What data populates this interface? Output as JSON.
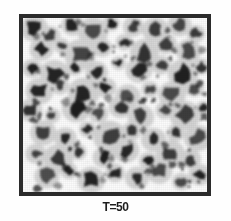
{
  "figure": {
    "caption": "T=50",
    "alt_label": "micrograph-panel",
    "frame": {
      "border_color": "#2b2b2b",
      "background_color": "#fbfbfb",
      "border_width_px": 4,
      "x": 19,
      "y": 14,
      "width": 192,
      "height": 182
    },
    "page_background": "#ffffff",
    "particle_color": "#1a1a1a",
    "halo_color": "#8a8a8a"
  },
  "chart_data": {
    "type": "scatter",
    "title": "T=50",
    "xlabel": "",
    "ylabel": "",
    "xlim": [
      0,
      100
    ],
    "ylim": [
      0,
      100
    ],
    "grid": false,
    "legend": null,
    "series": [
      {
        "name": "dark particles",
        "color": "#1a1a1a",
        "points": [
          {
            "x": 6,
            "y": 94,
            "r": 4.2
          },
          {
            "x": 15,
            "y": 90,
            "r": 3.0
          },
          {
            "x": 27,
            "y": 96,
            "r": 3.4
          },
          {
            "x": 38,
            "y": 92,
            "r": 4.6
          },
          {
            "x": 48,
            "y": 97,
            "r": 2.6
          },
          {
            "x": 60,
            "y": 95,
            "r": 3.2
          },
          {
            "x": 72,
            "y": 93,
            "r": 4.0
          },
          {
            "x": 85,
            "y": 96,
            "r": 3.6
          },
          {
            "x": 94,
            "y": 91,
            "r": 2.8
          },
          {
            "x": 10,
            "y": 82,
            "r": 3.6
          },
          {
            "x": 21,
            "y": 84,
            "r": 2.4
          },
          {
            "x": 31,
            "y": 79,
            "r": 4.8
          },
          {
            "x": 43,
            "y": 83,
            "r": 3.0
          },
          {
            "x": 55,
            "y": 86,
            "r": 2.6
          },
          {
            "x": 66,
            "y": 80,
            "r": 4.4
          },
          {
            "x": 78,
            "y": 85,
            "r": 3.2
          },
          {
            "x": 90,
            "y": 81,
            "r": 3.8
          },
          {
            "x": 5,
            "y": 71,
            "r": 3.0
          },
          {
            "x": 17,
            "y": 68,
            "r": 4.4
          },
          {
            "x": 28,
            "y": 72,
            "r": 2.8
          },
          {
            "x": 40,
            "y": 69,
            "r": 3.4
          },
          {
            "x": 52,
            "y": 74,
            "r": 2.2
          },
          {
            "x": 63,
            "y": 70,
            "r": 4.0
          },
          {
            "x": 75,
            "y": 73,
            "r": 3.0
          },
          {
            "x": 87,
            "y": 68,
            "r": 4.6
          },
          {
            "x": 97,
            "y": 72,
            "r": 2.6
          },
          {
            "x": 9,
            "y": 58,
            "r": 4.2
          },
          {
            "x": 20,
            "y": 61,
            "r": 2.8
          },
          {
            "x": 33,
            "y": 57,
            "r": 4.8
          },
          {
            "x": 45,
            "y": 60,
            "r": 3.2
          },
          {
            "x": 57,
            "y": 55,
            "r": 3.8
          },
          {
            "x": 69,
            "y": 59,
            "r": 2.6
          },
          {
            "x": 81,
            "y": 56,
            "r": 4.2
          },
          {
            "x": 93,
            "y": 60,
            "r": 3.0
          },
          {
            "x": 4,
            "y": 47,
            "r": 3.6
          },
          {
            "x": 16,
            "y": 44,
            "r": 2.4
          },
          {
            "x": 29,
            "y": 48,
            "r": 4.4
          },
          {
            "x": 41,
            "y": 45,
            "r": 3.0
          },
          {
            "x": 53,
            "y": 49,
            "r": 3.6
          },
          {
            "x": 64,
            "y": 43,
            "r": 4.0
          },
          {
            "x": 77,
            "y": 47,
            "r": 2.8
          },
          {
            "x": 88,
            "y": 44,
            "r": 4.6
          },
          {
            "x": 98,
            "y": 48,
            "r": 2.4
          },
          {
            "x": 11,
            "y": 34,
            "r": 4.0
          },
          {
            "x": 23,
            "y": 31,
            "r": 3.4
          },
          {
            "x": 35,
            "y": 36,
            "r": 2.6
          },
          {
            "x": 47,
            "y": 32,
            "r": 5.0
          },
          {
            "x": 59,
            "y": 35,
            "r": 3.0
          },
          {
            "x": 71,
            "y": 30,
            "r": 3.8
          },
          {
            "x": 83,
            "y": 34,
            "r": 2.8
          },
          {
            "x": 95,
            "y": 31,
            "r": 4.2
          },
          {
            "x": 7,
            "y": 22,
            "r": 3.2
          },
          {
            "x": 19,
            "y": 19,
            "r": 4.6
          },
          {
            "x": 30,
            "y": 23,
            "r": 2.6
          },
          {
            "x": 44,
            "y": 20,
            "r": 3.4
          },
          {
            "x": 56,
            "y": 24,
            "r": 4.0
          },
          {
            "x": 68,
            "y": 18,
            "r": 2.8
          },
          {
            "x": 80,
            "y": 22,
            "r": 4.4
          },
          {
            "x": 91,
            "y": 19,
            "r": 3.2
          },
          {
            "x": 13,
            "y": 9,
            "r": 3.8
          },
          {
            "x": 25,
            "y": 12,
            "r": 2.6
          },
          {
            "x": 37,
            "y": 7,
            "r": 4.2
          },
          {
            "x": 50,
            "y": 11,
            "r": 3.0
          },
          {
            "x": 62,
            "y": 8,
            "r": 3.6
          },
          {
            "x": 74,
            "y": 12,
            "r": 4.0
          },
          {
            "x": 86,
            "y": 6,
            "r": 2.8
          },
          {
            "x": 96,
            "y": 10,
            "r": 3.4
          }
        ]
      }
    ]
  }
}
